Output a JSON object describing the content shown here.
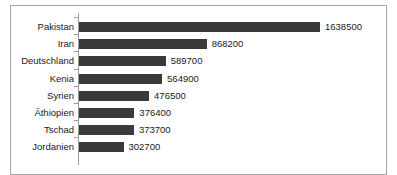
{
  "chart_data": {
    "type": "bar",
    "orientation": "horizontal",
    "title": "",
    "subtitle": "",
    "xlabel": "",
    "ylabel": "",
    "grid": false,
    "legend": false,
    "axis_line": true,
    "bar_color": "#3a3a3a",
    "frame_color": "#a6a6a6",
    "text_color": "#1a1a1a",
    "xlim": [
      0,
      1638500
    ],
    "categories": [
      "Pakistan",
      "Iran",
      "Deutschland",
      "Kenia",
      "Syrien",
      "Äthiopien",
      "Tschad",
      "Jordanien"
    ],
    "values": [
      1638500,
      868200,
      589700,
      564900,
      476500,
      376400,
      373700,
      302700
    ],
    "value_labels": [
      "1638500",
      "868200",
      "589700",
      "564900",
      "476500",
      "376400",
      "373700",
      "302700"
    ],
    "bars": [
      {
        "category": "Pakistan",
        "value": 1638500,
        "label": "1638500"
      },
      {
        "category": "Iran",
        "value": 868200,
        "label": "868200"
      },
      {
        "category": "Deutschland",
        "value": 589700,
        "label": "589700"
      },
      {
        "category": "Kenia",
        "value": 564900,
        "label": "564900"
      },
      {
        "category": "Syrien",
        "value": 476500,
        "label": "476500"
      },
      {
        "category": "Äthiopien",
        "value": 376400,
        "label": "376400"
      },
      {
        "category": "Tschad",
        "value": 373700,
        "label": "373700"
      },
      {
        "category": "Jordanien",
        "value": 302700,
        "label": "302700"
      }
    ]
  }
}
